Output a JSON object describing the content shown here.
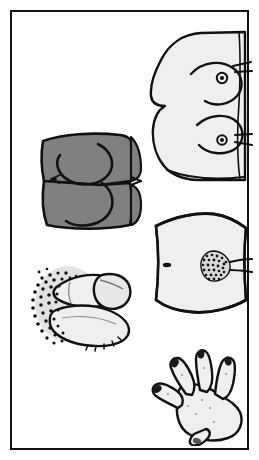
{
  "panel": {
    "title": "Anatomical Illustration Panel",
    "background_color": "#FFFFFF",
    "frame_color": "#111111",
    "frame_width_px": 2,
    "frame_inset_px": 10,
    "width_px": 259,
    "height_px": 460
  },
  "palette": {
    "ink": "#111111",
    "skin_light": "#EFEFEF",
    "skin_light_alt": "#E8E8E8",
    "skin_dark": "#808080",
    "halo_gray": "#E2E2E2",
    "stipple": "#111111",
    "white": "#FFFFFF"
  },
  "figures": [
    {
      "id": "torso-breasts",
      "name": "Female torso, breast profile view",
      "position": {
        "x": 143,
        "y": 28,
        "w": 108,
        "h": 152
      },
      "fill": "#EFEFEF",
      "outline": "#111111",
      "details": [
        "upper breast contour",
        "lower breast contour",
        "areola and nipple (upper)",
        "areola and nipple (lower)",
        "lateral skin folds"
      ]
    },
    {
      "id": "buttocks",
      "name": "Buttocks, posterior view",
      "position": {
        "x": 36,
        "y": 127,
        "w": 108,
        "h": 103
      },
      "fill": "#808080",
      "outline": "#111111",
      "details": [
        "gluteal cleft",
        "left gluteal contour",
        "right gluteal contour",
        "lateral skin crease marks"
      ]
    },
    {
      "id": "abdomen-pubis",
      "name": "Lower abdomen with pubic region",
      "position": {
        "x": 142,
        "y": 206,
        "w": 108,
        "h": 110
      },
      "fill": "#EFEFEF",
      "outline": "#111111",
      "details": [
        "umbilicus (navel)",
        "stippled pubic hair triangle",
        "inguinal crease lines"
      ]
    },
    {
      "id": "male-genitalia",
      "name": "Male genitalia with pubic hair",
      "position": {
        "x": 24,
        "y": 254,
        "w": 122,
        "h": 96
      },
      "fill": "#EFEFEF",
      "outline": "#111111",
      "halo_fill": "#E2E2E2",
      "details": [
        "dense stippled pubic hair field",
        "shaft contour",
        "glans",
        "scrotum"
      ]
    },
    {
      "id": "hand",
      "name": "Left hand, dorsal view with fingers spread",
      "position": {
        "x": 146,
        "y": 340,
        "w": 100,
        "h": 102
      },
      "fill": "#EFEFEF",
      "outline": "#111111",
      "details": [
        "thumb",
        "index finger",
        "middle finger",
        "ring finger",
        "little finger",
        "darkened fingernails",
        "knuckle marks"
      ]
    }
  ]
}
